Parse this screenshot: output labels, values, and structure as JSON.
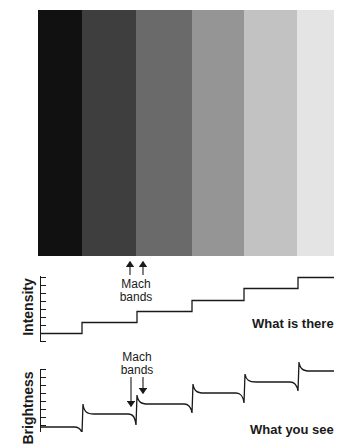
{
  "stripes": {
    "colors": [
      "#111111",
      "#3e3e3e",
      "#6a6a6a",
      "#959595",
      "#c2c2c2",
      "#e4e4e4"
    ],
    "boundaries_x": [
      38,
      82,
      136,
      192,
      244,
      297,
      334
    ]
  },
  "upper_annotation": {
    "label_line1": "Mach",
    "label_line2": "bands",
    "arrow_direction": "up"
  },
  "intensity_panel": {
    "axis_label": "Intensity",
    "caption": "What is there",
    "steps": 6
  },
  "lower_annotation": {
    "label_line1": "Mach",
    "label_line2": "bands",
    "arrow_direction": "down"
  },
  "brightness_panel": {
    "axis_label": "Brightness",
    "caption": "What you see",
    "steps": 6,
    "features": "overshoot and undershoot at each edge (Mach bands)"
  }
}
